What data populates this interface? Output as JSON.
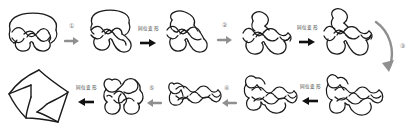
{
  "figure": {
    "background_color": "#ffffff",
    "stroke_color": "#1a1a1a",
    "gray_arrow_color": "#8f8f8f",
    "black_arrow_color": "#111111",
    "step_label_color": "#6b6b6b",
    "op_label_color": "#3a3a3a"
  },
  "operations": {
    "isotopy": "同位变形"
  },
  "steps": [
    {
      "id": "step-1",
      "label": "①",
      "direction": "right",
      "arrow_color": "#8f8f8f"
    },
    {
      "id": "step-2",
      "label": "②",
      "direction": "right",
      "arrow_color": "#8f8f8f"
    },
    {
      "id": "step-3",
      "label": "③",
      "direction": "down-curve",
      "arrow_color": "#8f8f8f"
    },
    {
      "id": "step-4",
      "label": "④",
      "direction": "left",
      "arrow_color": "#8f8f8f"
    },
    {
      "id": "step-5",
      "label": "⑤",
      "direction": "left",
      "arrow_color": "#8f8f8f"
    }
  ],
  "isotopy_arrows": [
    {
      "id": "isotopy-1",
      "label": "同位变形",
      "direction": "right"
    },
    {
      "id": "isotopy-2",
      "label": "同位变形",
      "direction": "right"
    },
    {
      "id": "isotopy-3",
      "label": "同位变形",
      "direction": "left"
    },
    {
      "id": "isotopy-4",
      "label": "同位变形",
      "direction": "left"
    }
  ],
  "knots": [
    {
      "id": "knot-1",
      "name": "braided-closure-knot",
      "row": "top",
      "position": 1
    },
    {
      "id": "knot-2",
      "name": "deformed-knot-a",
      "row": "top",
      "position": 2
    },
    {
      "id": "knot-3",
      "name": "deformed-knot-b",
      "row": "top",
      "position": 3
    },
    {
      "id": "knot-4",
      "name": "compact-crossing-knot",
      "row": "top",
      "position": 4
    },
    {
      "id": "knot-5",
      "name": "expanded-knot-a",
      "row": "top",
      "position": 5
    },
    {
      "id": "knot-6",
      "name": "expanded-knot-b",
      "row": "top",
      "position": 6
    },
    {
      "id": "knot-7",
      "name": "wide-braid-knot-a",
      "row": "bottom",
      "position": 1
    },
    {
      "id": "knot-8",
      "name": "wide-braid-knot-b",
      "row": "bottom",
      "position": 2
    },
    {
      "id": "knot-9",
      "name": "twisted-band-knot",
      "row": "bottom",
      "position": 3
    },
    {
      "id": "knot-10",
      "name": "rounded-lobed-knot",
      "row": "bottom",
      "position": 4
    },
    {
      "id": "knot-11",
      "name": "pentagram-star-knot",
      "row": "bottom",
      "position": 5
    }
  ]
}
